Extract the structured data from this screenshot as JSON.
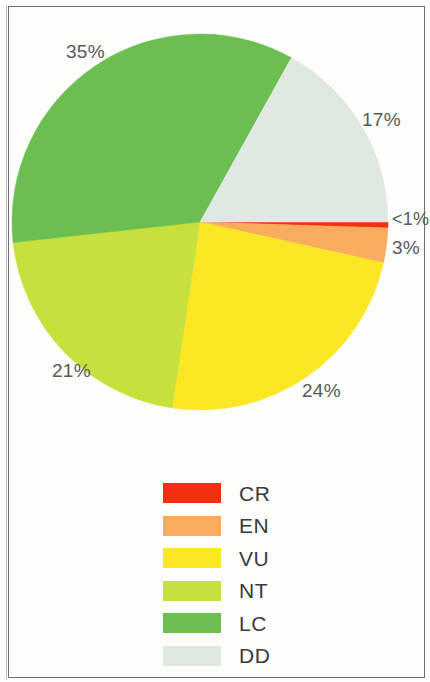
{
  "chart_data": {
    "type": "pie",
    "title": "",
    "subtitle": "",
    "xlabel": "",
    "ylabel": "",
    "grid": false,
    "legend_position": "bottom",
    "categories": [
      "CR",
      "EN",
      "VU",
      "NT",
      "LC",
      "DD"
    ],
    "values": [
      0.5,
      3,
      24,
      21,
      35,
      17
    ],
    "labels": [
      "<1%",
      "3%",
      "24%",
      "21%",
      "35%",
      "17%"
    ],
    "colors": [
      "#f42f10",
      "#f9ac5e",
      "#fbe724",
      "#c8e03c",
      "#6cbe50",
      "#dfe9e2"
    ],
    "slices": [
      {
        "name": "CR",
        "label": "<1%",
        "value": 0.5,
        "color": "#f42f10"
      },
      {
        "name": "EN",
        "label": "3%",
        "value": 3,
        "color": "#f9ac5e"
      },
      {
        "name": "VU",
        "label": "24%",
        "value": 24,
        "color": "#fbe724"
      },
      {
        "name": "NT",
        "label": "21%",
        "value": 21,
        "color": "#c8e03c"
      },
      {
        "name": "LC",
        "label": "35%",
        "value": 35,
        "color": "#6cbe50"
      },
      {
        "name": "DD",
        "label": "17%",
        "value": 17,
        "color": "#dfe9e2"
      }
    ],
    "start_angle_deg": 0,
    "direction": "clockwise"
  },
  "pie": {
    "label_lc": "35%",
    "label_dd": "17%",
    "label_cr": "<1%",
    "label_en": "3%",
    "label_nt": "21%",
    "label_vu": "24%"
  },
  "legend": {
    "items": [
      {
        "label": "CR",
        "color": "#f42f10"
      },
      {
        "label": "EN",
        "color": "#f9ac5e"
      },
      {
        "label": "VU",
        "color": "#fbe724"
      },
      {
        "label": "NT",
        "color": "#c8e03c"
      },
      {
        "label": "LC",
        "color": "#6cbe50"
      },
      {
        "label": "DD",
        "color": "#dfe9e2"
      }
    ]
  }
}
